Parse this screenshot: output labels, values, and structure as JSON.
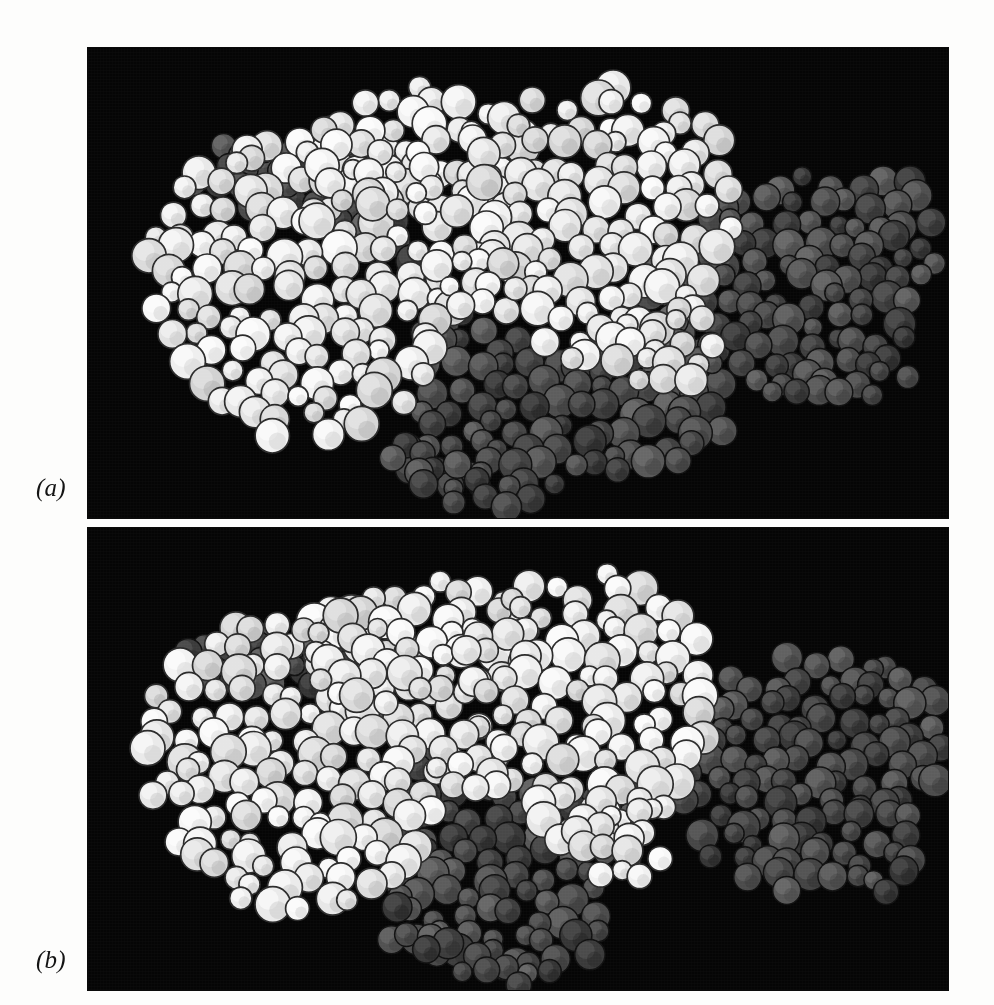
{
  "figure": {
    "background_color": "#fdfdfc",
    "panel_background_color": "#050505",
    "panels": [
      {
        "id": "a",
        "label": "(a)",
        "caption_style": "italic-serif",
        "representation": "space-filling CPK spheres",
        "description": "Closed conformation: large light-grey subunit packed against dark-grey subunits forming a continuous assembly with a narrow central cleft.",
        "subunits": [
          {
            "name": "light-subunit-left",
            "shade": "light",
            "color": "#e3e3e1"
          },
          {
            "name": "light-subunit-right",
            "shade": "light",
            "color": "#e6e6e4"
          },
          {
            "name": "dark-subunit-center",
            "shade": "dark",
            "color": "#3a3a3a"
          },
          {
            "name": "dark-subunit-right",
            "shade": "dark",
            "color": "#4a4a4a"
          }
        ]
      },
      {
        "id": "b",
        "label": "(b)",
        "caption_style": "italic-serif",
        "representation": "space-filling CPK spheres",
        "description": "Open conformation: the right-hand dark-grey subunit has dissociated and sits detached from the light-grey core, leaving a black gap between the two domains.",
        "subunits": [
          {
            "name": "light-subunit-left",
            "shade": "light",
            "color": "#e3e3e1"
          },
          {
            "name": "light-subunit-right",
            "shade": "light",
            "color": "#e6e6e4"
          },
          {
            "name": "dark-subunit-center",
            "shade": "dark",
            "color": "#4a4a4a"
          },
          {
            "name": "dark-subunit-detached",
            "shade": "dark",
            "color": "#515151"
          }
        ]
      }
    ],
    "colors": {
      "light_sphere_fill": "#e5e5e3",
      "light_sphere_outline": "#2b2b2b",
      "dark_sphere_fill": "#454545",
      "dark_sphere_outline": "#111111",
      "panel_black": "#050505",
      "page_white": "#fdfdfc",
      "label_ink": "#141414"
    }
  }
}
